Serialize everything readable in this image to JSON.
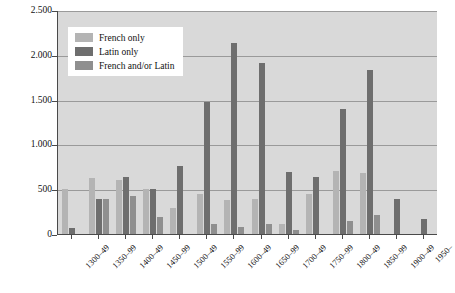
{
  "chart_data": {
    "type": "bar",
    "title": "",
    "subtitle": "",
    "xlabel": "",
    "ylabel": "",
    "ylim": [
      0,
      2500
    ],
    "yticks": [
      0,
      500,
      1000,
      1500,
      2000,
      2500
    ],
    "ytick_labels": [
      "0",
      "500",
      "1.000",
      "1.500",
      "2.000",
      "2.500"
    ],
    "grid": true,
    "legend_position": "top-left",
    "categories": [
      "1300–49",
      "1350–99",
      "1400–49",
      "1450–99",
      "1500–49",
      "1550–99",
      "1600–49",
      "1650–99",
      "1700–49",
      "1750–99",
      "1800–49",
      "1850–99",
      "1900–49",
      "1950–"
    ],
    "series": [
      {
        "name": "French only",
        "color": "#b4b4b4",
        "values": [
          500,
          630,
          600,
          500,
          290,
          450,
          380,
          390,
          110,
          450,
          700,
          680,
          0,
          0
        ]
      },
      {
        "name": "Latin only",
        "color": "#6e6e6e",
        "values": [
          70,
          390,
          640,
          500,
          760,
          1470,
          2130,
          1910,
          690,
          640,
          1390,
          1830,
          390,
          170
        ]
      },
      {
        "name": "French and/or Latin",
        "color": "#8f8f8f",
        "values": [
          0,
          390,
          420,
          190,
          0,
          110,
          80,
          110,
          40,
          0,
          150,
          210,
          0,
          0
        ]
      }
    ]
  },
  "legend": {
    "items": [
      {
        "label": "French only",
        "color": "#b4b4b4"
      },
      {
        "label": "Latin only",
        "color": "#6e6e6e"
      },
      {
        "label": "French and/or Latin",
        "color": "#8f8f8f"
      }
    ]
  }
}
